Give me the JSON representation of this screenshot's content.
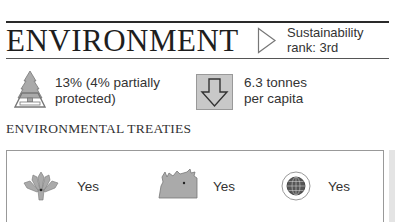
{
  "section": {
    "title": "ENVIRONMENT",
    "rank": {
      "icon": "triangle-right-icon",
      "label": "Sustainability",
      "value": "rank: 3rd"
    }
  },
  "stats": {
    "forest": {
      "icon": "tree-icon",
      "line1": "13% (4% partially",
      "line2": "protected)"
    },
    "co2": {
      "icon": "down-arrow-icon",
      "line1": "6.3 tonnes",
      "line2": "per capita"
    }
  },
  "treaties": {
    "heading": "ENVIRONMENTAL TREATIES",
    "items": [
      {
        "icon": "plant-icon",
        "value": "Yes"
      },
      {
        "icon": "rhino-icon",
        "value": "Yes"
      },
      {
        "icon": "globe-icon",
        "value": "Yes"
      }
    ]
  },
  "colors": {
    "rule": "#2a2a2a",
    "icon_fill": "#a8a8a8",
    "icon_stroke": "#666666",
    "text": "#333333"
  }
}
